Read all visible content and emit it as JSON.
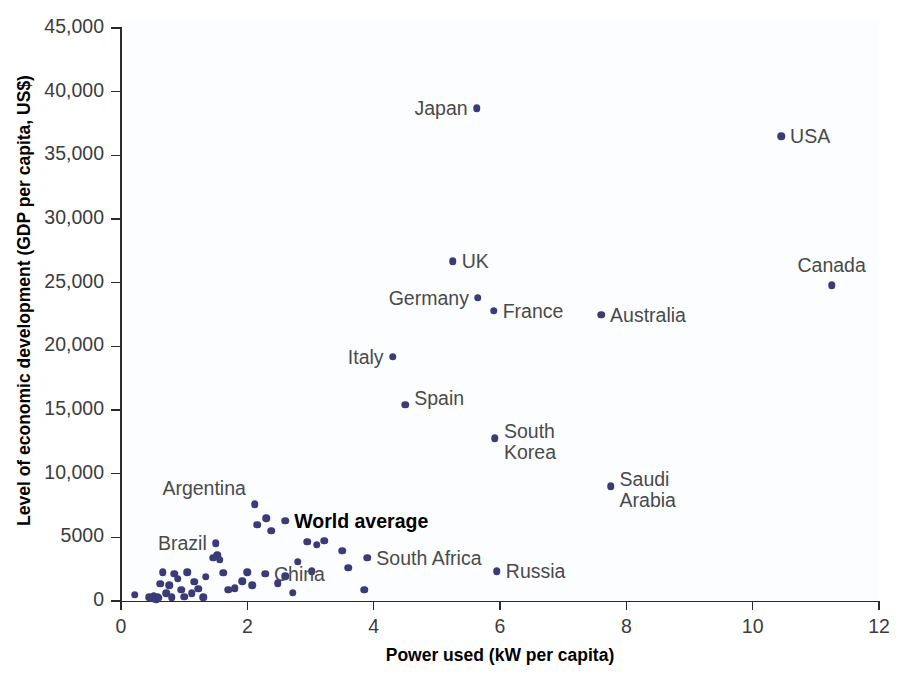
{
  "chart_data": {
    "type": "scatter",
    "title": "",
    "xlabel": "Power used (kW per capita)",
    "ylabel": "Level of economic development (GDP per capita, US$)",
    "xlim": [
      0,
      12
    ],
    "ylim": [
      0,
      45000
    ],
    "grid": false,
    "legend": "none",
    "xticks": [
      "0",
      "2",
      "4",
      "6",
      "8",
      "10",
      "12"
    ],
    "xtick_values": [
      0,
      2,
      4,
      6,
      8,
      10,
      12
    ],
    "yticks": [
      "0",
      "5000",
      "10,000",
      "15,000",
      "20,000",
      "25,000",
      "30,000",
      "35,000",
      "40,000",
      "45,000"
    ],
    "ytick_values": [
      0,
      5000,
      10000,
      15000,
      20000,
      25000,
      30000,
      35000,
      40000,
      45000
    ],
    "marker_color": "#3b3b78",
    "labeled_points": [
      {
        "name": "Japan",
        "x": 5.63,
        "y": 38700,
        "label": "Japan",
        "pos": "right"
      },
      {
        "name": "USA",
        "x": 10.45,
        "y": 36500,
        "label": "USA",
        "pos": "left"
      },
      {
        "name": "Canada",
        "x": 11.25,
        "y": 24800,
        "label": "Canada",
        "pos": "above"
      },
      {
        "name": "UK",
        "x": 5.25,
        "y": 26700,
        "label": "UK",
        "pos": "left"
      },
      {
        "name": "Germany",
        "x": 5.65,
        "y": 23800,
        "label": "Germany",
        "pos": "right"
      },
      {
        "name": "France",
        "x": 5.9,
        "y": 22800,
        "label": "France",
        "pos": "left"
      },
      {
        "name": "Australia",
        "x": 7.6,
        "y": 22500,
        "label": "Australia",
        "pos": "left"
      },
      {
        "name": "Italy",
        "x": 4.3,
        "y": 19200,
        "label": "Italy",
        "pos": "right"
      },
      {
        "name": "Spain",
        "x": 4.5,
        "y": 15400,
        "label": "Spain",
        "pos": "topright"
      },
      {
        "name": "South Korea",
        "x": 5.92,
        "y": 12800,
        "label": "South\nKorea",
        "pos": "topright"
      },
      {
        "name": "Saudi Arabia",
        "x": 7.75,
        "y": 9000,
        "label": "Saudi\nArabia",
        "pos": "topright"
      },
      {
        "name": "World average",
        "x": 2.6,
        "y": 6300,
        "label": "World average",
        "pos": "left",
        "bold": true
      },
      {
        "name": "Argentina",
        "x": 2.12,
        "y": 7600,
        "label": "Argentina",
        "pos": "above-left"
      },
      {
        "name": "Brazil",
        "x": 1.5,
        "y": 4550,
        "label": "Brazil",
        "pos": "right"
      },
      {
        "name": "China",
        "x": 2.28,
        "y": 2150,
        "label": "China",
        "pos": "left"
      },
      {
        "name": "South Africa",
        "x": 3.9,
        "y": 3400,
        "label": "South Africa",
        "pos": "left"
      },
      {
        "name": "Russia",
        "x": 5.95,
        "y": 2350,
        "label": "Russia",
        "pos": "left"
      }
    ],
    "unlabeled_points": [
      {
        "x": 0.22,
        "y": 500
      },
      {
        "x": 0.45,
        "y": 300
      },
      {
        "x": 0.5,
        "y": 200
      },
      {
        "x": 0.52,
        "y": 420
      },
      {
        "x": 0.56,
        "y": 150
      },
      {
        "x": 0.58,
        "y": 330
      },
      {
        "x": 0.6,
        "y": 250
      },
      {
        "x": 0.62,
        "y": 1350
      },
      {
        "x": 0.66,
        "y": 2250
      },
      {
        "x": 0.72,
        "y": 600
      },
      {
        "x": 0.76,
        "y": 1250
      },
      {
        "x": 0.8,
        "y": 300
      },
      {
        "x": 0.84,
        "y": 2150
      },
      {
        "x": 0.9,
        "y": 1750
      },
      {
        "x": 0.95,
        "y": 900
      },
      {
        "x": 1.0,
        "y": 350
      },
      {
        "x": 1.05,
        "y": 2250
      },
      {
        "x": 1.12,
        "y": 600
      },
      {
        "x": 1.16,
        "y": 1500
      },
      {
        "x": 1.22,
        "y": 950
      },
      {
        "x": 1.3,
        "y": 300
      },
      {
        "x": 1.34,
        "y": 1900
      },
      {
        "x": 1.46,
        "y": 3400
      },
      {
        "x": 1.52,
        "y": 3600
      },
      {
        "x": 1.56,
        "y": 3250
      },
      {
        "x": 1.62,
        "y": 2200
      },
      {
        "x": 1.7,
        "y": 900
      },
      {
        "x": 1.8,
        "y": 1000
      },
      {
        "x": 1.92,
        "y": 1550
      },
      {
        "x": 2.0,
        "y": 2250
      },
      {
        "x": 2.08,
        "y": 1250
      },
      {
        "x": 2.16,
        "y": 6000
      },
      {
        "x": 2.3,
        "y": 6500
      },
      {
        "x": 2.38,
        "y": 5500
      },
      {
        "x": 2.48,
        "y": 1400
      },
      {
        "x": 2.6,
        "y": 1950
      },
      {
        "x": 2.72,
        "y": 650
      },
      {
        "x": 2.8,
        "y": 3100
      },
      {
        "x": 2.95,
        "y": 4650
      },
      {
        "x": 3.02,
        "y": 2350
      },
      {
        "x": 3.1,
        "y": 4400
      },
      {
        "x": 3.22,
        "y": 4750
      },
      {
        "x": 3.5,
        "y": 3950
      },
      {
        "x": 3.6,
        "y": 2600
      },
      {
        "x": 3.85,
        "y": 900
      }
    ]
  },
  "axis_titles": {
    "x": "Power used (kW per capita)",
    "y": "Level of economic development (GDP per capita, US$)"
  }
}
